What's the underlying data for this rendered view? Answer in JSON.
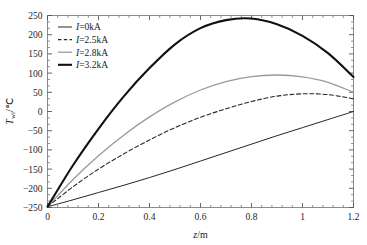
{
  "chart_data": {
    "type": "line",
    "title": "",
    "xlabel": "z/m",
    "ylabel": "T_wi/℃",
    "ylabel_main": "T",
    "ylabel_sub": "wi",
    "ylabel_unit": "/℃",
    "xlim": [
      0,
      1.2
    ],
    "ylim": [
      -250,
      250
    ],
    "xticks": [
      0,
      0.2,
      0.4,
      0.6,
      0.8,
      1,
      1.2
    ],
    "xtick_labels": [
      "0",
      "0.2",
      "0.4",
      "0.6",
      "0.8",
      "1",
      "1.2"
    ],
    "yticks": [
      250,
      200,
      150,
      100,
      50,
      0,
      -50,
      -100,
      -150,
      -200,
      -250
    ],
    "ytick_labels": [
      "250",
      "200",
      "150",
      "100",
      "50",
      "0",
      "−50",
      "−100",
      "−150",
      "−200",
      "−250"
    ],
    "x_minor_ticks_per_major": 4,
    "y_minor_ticks_per_major": 2,
    "grid": false,
    "legend_position": "top-left",
    "series": [
      {
        "name": "I=0kA",
        "label_italic": "I",
        "label_rest": "=0kA",
        "color": "#262626",
        "style": "solid",
        "width": 1.0,
        "x": [
          0,
          0.1,
          0.2,
          0.3,
          0.4,
          0.5,
          0.6,
          0.7,
          0.8,
          0.9,
          1.0,
          1.1,
          1.2
        ],
        "values": [
          -248,
          -230,
          -211,
          -192,
          -172,
          -151,
          -129,
          -107,
          -85,
          -63,
          -42,
          -21,
          0
        ]
      },
      {
        "name": "I=2.5kA",
        "label_italic": "I",
        "label_rest": "=2.5kA",
        "color": "#262626",
        "style": "dashed",
        "width": 1.1,
        "x": [
          0,
          0.1,
          0.2,
          0.3,
          0.4,
          0.5,
          0.6,
          0.7,
          0.8,
          0.9,
          1.0,
          1.1,
          1.2
        ],
        "values": [
          -248,
          -196,
          -150,
          -110,
          -74,
          -42,
          -15,
          7,
          26,
          40,
          46,
          44,
          33
        ]
      },
      {
        "name": "I=2.8kA",
        "label_italic": "I",
        "label_rest": "=2.8kA",
        "color": "#9a9a9a",
        "style": "solid",
        "width": 1.3,
        "x": [
          0,
          0.1,
          0.2,
          0.3,
          0.4,
          0.5,
          0.6,
          0.7,
          0.8,
          0.9,
          1.0,
          1.1,
          1.2
        ],
        "values": [
          -248,
          -177,
          -115,
          -61,
          -14,
          25,
          56,
          78,
          91,
          95,
          90,
          76,
          50
        ]
      },
      {
        "name": "I=3.2kA",
        "label_italic": "I",
        "label_rest": "=3.2kA",
        "color": "#111111",
        "style": "solid",
        "width": 2.1,
        "x": [
          0,
          0.1,
          0.2,
          0.3,
          0.4,
          0.5,
          0.6,
          0.7,
          0.8,
          0.9,
          1.0,
          1.1,
          1.2
        ],
        "values": [
          -248,
          -140,
          -45,
          40,
          113,
          175,
          217,
          238,
          242,
          227,
          197,
          152,
          90
        ]
      }
    ],
    "annotations": []
  }
}
